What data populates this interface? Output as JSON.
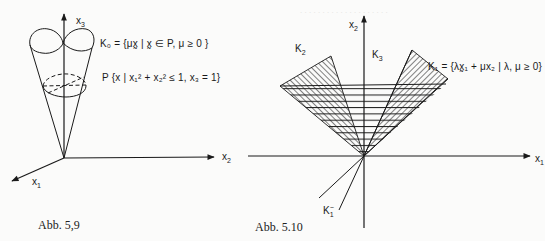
{
  "figures": [
    {
      "caption": "Abb. 5,9",
      "axes": {
        "x1": "x",
        "x1_sub": "1",
        "x2": "x",
        "x2_sub": "2",
        "x3": "x",
        "x3_sub": "3"
      },
      "labels": {
        "K0_formula": "K₀ = {μx̰ | x̰ ∈ P, μ ≥ 0 }",
        "P_formula": "P {x | x₁² + x₂² ≤ 1, x₃ = 1}"
      }
    },
    {
      "caption": "Abb. 5.10",
      "axes": {
        "x1": "x",
        "x1_sub": "1",
        "x2": "x",
        "x2_sub": "2"
      },
      "labels": {
        "K2": "K",
        "K2_sub": "2",
        "K3": "K",
        "K3_sub": "3",
        "K1_formula": "K₁ = {λx̰₁ + μx₂ | λ, μ ≥ 0}",
        "K1_minus": "K",
        "K1_minus_sub": "1",
        "K1_minus_sup": "−"
      }
    }
  ],
  "colors": {
    "ink": "#1a1a1a",
    "paper": "#fbfbfa",
    "bleed": "#e4e4e2"
  }
}
